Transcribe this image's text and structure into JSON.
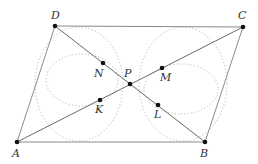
{
  "diagram": {
    "type": "geometry",
    "points": {
      "A": {
        "label": "A",
        "x": 17,
        "y": 142
      },
      "B": {
        "label": "B",
        "x": 205,
        "y": 142
      },
      "C": {
        "label": "C",
        "x": 243,
        "y": 27
      },
      "D": {
        "label": "D",
        "x": 55,
        "y": 26
      },
      "P": {
        "label": "P",
        "x": 130,
        "y": 84
      },
      "N": {
        "label": "N",
        "x": 103,
        "y": 63
      },
      "M": {
        "label": "M",
        "x": 162,
        "y": 68
      },
      "K": {
        "label": "K",
        "x": 100,
        "y": 100
      },
      "L": {
        "label": "L",
        "x": 158,
        "y": 105
      }
    },
    "segments": [
      "AB",
      "BC",
      "CD",
      "DA",
      "AC",
      "BD"
    ],
    "circles": [
      {
        "name": "left-outer",
        "cx": 79,
        "cy": 84,
        "rx": 44,
        "ry": 57
      },
      {
        "name": "left-inner",
        "cx": 82,
        "cy": 80,
        "rx": 36,
        "ry": 26
      },
      {
        "name": "right-outer",
        "cx": 183,
        "cy": 84,
        "rx": 44,
        "ry": 57
      },
      {
        "name": "right-inner",
        "cx": 181,
        "cy": 89,
        "rx": 37,
        "ry": 25
      }
    ],
    "labels": {
      "A": "A",
      "B": "B",
      "C": "C",
      "D": "D",
      "P": "P",
      "N": "N",
      "M": "M",
      "K": "K",
      "L": "L"
    }
  }
}
